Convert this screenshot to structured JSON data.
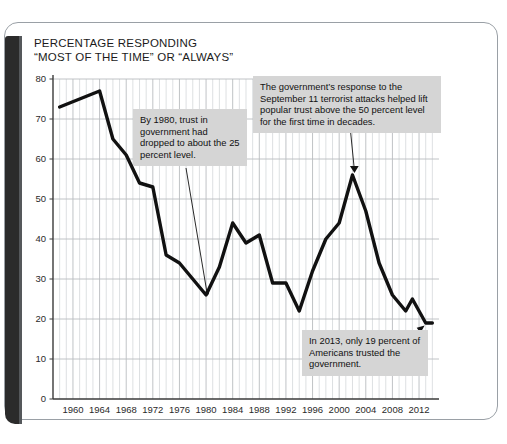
{
  "figure": {
    "title_line1": "PERCENTAGE RESPONDING",
    "title_line2": "“MOST OF THE TIME” OR “ALWAYS”",
    "title_full": "PERCENTAGE RESPONDING\n“MOST OF THE TIME” OR “ALWAYS”",
    "line_color": "#111111",
    "grid_color": "#b9bcc0",
    "callout_bg": "#d5d5d5",
    "frame_color": "#9aa0a6"
  },
  "annotations": {
    "a1": {
      "text": "By 1980, trust in government had dropped to about the 25 percent level.",
      "target_year": 1980,
      "target_value": 26
    },
    "a2": {
      "text": "The government’s response to the September 11 terrorist attacks helped lift popular trust above the 50 percent level for the first time in decades.",
      "target_year": 2002,
      "target_value": 56
    },
    "a3": {
      "text": "In 2013, only 19 percent of Americans trusted the government.",
      "target_year": 2013,
      "target_value": 19
    }
  },
  "chart_data": {
    "type": "line",
    "title": "PERCENTAGE RESPONDING “MOST OF THE TIME” OR “ALWAYS”",
    "xlabel": "",
    "ylabel": "",
    "xlim": [
      1957,
      2015
    ],
    "ylim": [
      0,
      80
    ],
    "yticks": [
      0,
      10,
      20,
      30,
      40,
      50,
      60,
      70,
      80
    ],
    "ytick_labels": [
      "0",
      "10",
      "20",
      "30",
      "40",
      "50",
      "60",
      "70",
      "80"
    ],
    "xticks": [
      1960,
      1964,
      1968,
      1972,
      1976,
      1980,
      1984,
      1988,
      1992,
      1996,
      2000,
      2004,
      2008,
      2012
    ],
    "xtick_labels": [
      "1960",
      "1964",
      "1968",
      "1972",
      "1976",
      "1980",
      "1984",
      "1988",
      "1992",
      "1996",
      "2000",
      "2004",
      "2008",
      "2012"
    ],
    "grid": true,
    "minor_grid_x_every": 1,
    "legend": null,
    "series": [
      {
        "name": "Trust in government",
        "color": "#111111",
        "x": [
          1958,
          1964,
          1966,
          1968,
          1970,
          1972,
          1974,
          1976,
          1978,
          1980,
          1982,
          1984,
          1986,
          1988,
          1990,
          1992,
          1994,
          1996,
          1998,
          2000,
          2002,
          2004,
          2006,
          2008,
          2010,
          2011,
          2013,
          2014
        ],
        "values": [
          73,
          77,
          65,
          61,
          54,
          53,
          36,
          34,
          30,
          26,
          33,
          44,
          39,
          41,
          29,
          29,
          22,
          32,
          40,
          44,
          56,
          47,
          34,
          26,
          22,
          25,
          19,
          19
        ]
      }
    ]
  }
}
